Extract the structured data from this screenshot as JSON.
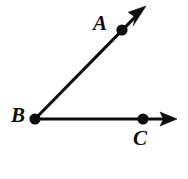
{
  "figure": {
    "type": "geometry-diagram",
    "background_color": "#ffffff",
    "stroke_color": "#0d0d0d",
    "canvas": {
      "width": 188,
      "height": 179
    },
    "labels": {
      "a": "A",
      "b": "B",
      "c": "C"
    },
    "points": [
      {
        "name": "A",
        "label": "A",
        "x": 122,
        "y": 30,
        "dot_radius": 5.6,
        "label_x": 93,
        "label_y": 13
      },
      {
        "name": "B",
        "label": "B",
        "x": 35,
        "y": 119,
        "dot_radius": 5.6,
        "label_x": 11,
        "label_y": 105
      },
      {
        "name": "C",
        "label": "C",
        "x": 143,
        "y": 119,
        "dot_radius": 5.6,
        "label_x": 133,
        "label_y": 128
      }
    ],
    "rays": [
      {
        "name": "ray-BA",
        "from": "B",
        "through": "A",
        "start_x": 35,
        "start_y": 119,
        "end_x": 146,
        "end_y": 6,
        "arrowhead": "end"
      },
      {
        "name": "ray-BC",
        "from": "B",
        "through": "C",
        "start_x": 35,
        "start_y": 119,
        "end_x": 177,
        "end_y": 119,
        "arrowhead": "end"
      }
    ]
  }
}
